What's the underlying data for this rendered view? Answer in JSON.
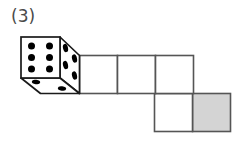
{
  "figure": {
    "label": "(3)",
    "caption_color": "#4a4a4a",
    "background": "#ffffff"
  },
  "die": {
    "name": "three-dimensional-die",
    "projection": "oblique",
    "stroke_color": "#1a1a1a",
    "face_fill": "#ffffff",
    "pip_color": "#000000",
    "faces": [
      {
        "name": "front-face",
        "pip_count": 6,
        "pip_layout": "2x3"
      },
      {
        "name": "right-face",
        "pip_count": 4,
        "pip_layout": "2x2"
      },
      {
        "name": "bottom-face",
        "pip_count": 2,
        "pip_layout": "diagonal"
      }
    ]
  },
  "net": {
    "name": "cube-net-grid",
    "stroke_color": "#555555",
    "cell_size_px": 37,
    "rows": [
      {
        "name": "top-row",
        "cells": [
          {
            "name": "cell-1",
            "fill": "#ffffff",
            "shaded": false
          },
          {
            "name": "cell-2",
            "fill": "#ffffff",
            "shaded": false
          },
          {
            "name": "cell-3",
            "fill": "#ffffff",
            "shaded": false
          }
        ]
      },
      {
        "name": "bottom-row",
        "cells": [
          {
            "name": "cell-4",
            "fill": "#ffffff",
            "shaded": false
          },
          {
            "name": "cell-5",
            "fill": "#d4d4d4",
            "shaded": true
          }
        ]
      }
    ],
    "shaded_fill": "#d4d4d4"
  }
}
